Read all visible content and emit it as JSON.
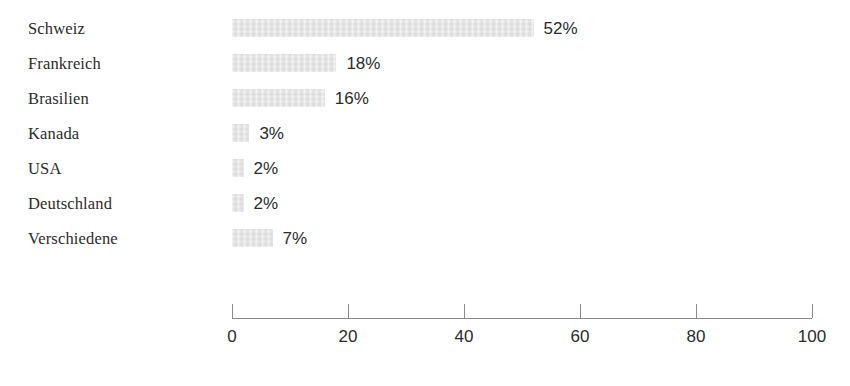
{
  "chart_data": {
    "type": "bar",
    "orientation": "horizontal",
    "title": "",
    "subtitle": "",
    "xlabel": "",
    "ylabel": "",
    "categories": [
      "Schweiz",
      "Frankreich",
      "Brasilien",
      "Kanada",
      "USA",
      "Deutschland",
      "Verschiedene"
    ],
    "values": [
      52,
      18,
      16,
      3,
      2,
      2,
      7
    ],
    "value_labels": [
      "52%",
      "18%",
      "16%",
      "3%",
      "2%",
      "2%",
      "7%"
    ],
    "unit": "%",
    "xlim": [
      0,
      100
    ],
    "x_ticks": [
      0,
      20,
      40,
      60,
      80,
      100
    ],
    "x_tick_labels": [
      "0",
      "20",
      "40",
      "60",
      "80",
      "100"
    ],
    "grid": false,
    "legend": false,
    "legend_entries": [],
    "annotations": [],
    "series": [
      {
        "name": "",
        "values": [
          52,
          18,
          16,
          3,
          2,
          2,
          7
        ]
      }
    ]
  },
  "style": {
    "background_color": "#ffffff",
    "bar_color": "#e5e5e5",
    "text_color": "#2b2b2b",
    "axis_color": "#8a8a8a"
  }
}
